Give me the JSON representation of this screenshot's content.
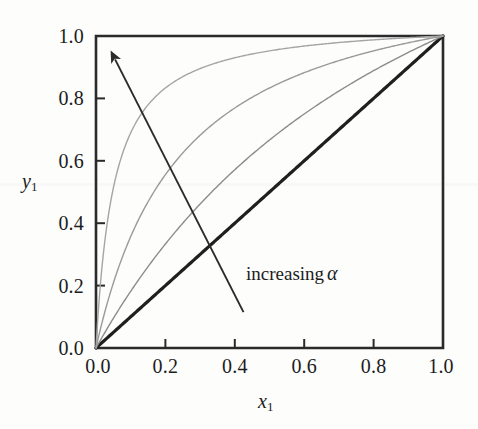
{
  "figure": {
    "name": "vapor-liquid-equilibrium-xy-diagram",
    "background_color": "#fdfdfc",
    "ink_color": "#1c1c1c"
  },
  "axes": {
    "x_title": "x",
    "x_title_sub": "1",
    "y_title": "y",
    "y_title_sub": "1",
    "x_tick_labels": [
      "0.0",
      "0.2",
      "0.4",
      "0.6",
      "0.8",
      "1.0"
    ],
    "y_tick_labels": [
      "0.0",
      "0.2",
      "0.4",
      "0.6",
      "0.8",
      "1.0"
    ],
    "x_tick_values": [
      0.0,
      0.2,
      0.4,
      0.6,
      0.8,
      1.0
    ],
    "y_tick_values": [
      0.0,
      0.2,
      0.4,
      0.6,
      0.8,
      1.0
    ],
    "frame_color": "#2a2a2a",
    "tick_direction": "in"
  },
  "annotation": {
    "label_text": "increasing",
    "label_symbol": "α",
    "arrow_start": [
      0.425,
      0.115
    ],
    "arrow_end": [
      0.055,
      0.925
    ],
    "arrow_color": "#2b2b2b"
  },
  "chart_data": {
    "type": "line",
    "title": "",
    "subtitle": "",
    "xlabel": "x1",
    "ylabel": "y1",
    "xlim": [
      0.0,
      1.0
    ],
    "ylim": [
      0.0,
      1.0
    ],
    "grid": false,
    "legend": "none",
    "annotations": [
      {
        "text": "increasing α",
        "x": 0.55,
        "y": 0.26,
        "arrow_from": [
          0.425,
          0.115
        ],
        "arrow_to": [
          0.055,
          0.925
        ]
      }
    ],
    "relation": "y1 = alpha*x1 / (1 + (alpha - 1)*x1)",
    "series": [
      {
        "name": "alpha = 1",
        "alpha": 1,
        "color": "#1f1f1f",
        "width": 3.2,
        "x": [
          0.0,
          0.1,
          0.2,
          0.3,
          0.4,
          0.5,
          0.6,
          0.7,
          0.8,
          0.9,
          1.0
        ],
        "values": [
          0.0,
          0.1,
          0.2,
          0.3,
          0.4,
          0.5,
          0.6,
          0.7,
          0.8,
          0.9,
          1.0
        ]
      },
      {
        "name": "alpha = 2",
        "alpha": 2,
        "color": "#8c8c8c",
        "width": 1.4,
        "x": [
          0.0,
          0.1,
          0.2,
          0.3,
          0.4,
          0.5,
          0.6,
          0.7,
          0.8,
          0.9,
          1.0
        ],
        "values": [
          0.0,
          0.182,
          0.333,
          0.462,
          0.571,
          0.667,
          0.75,
          0.824,
          0.889,
          0.947,
          1.0
        ]
      },
      {
        "name": "alpha = 5",
        "alpha": 5,
        "color": "#9a9a9a",
        "width": 1.4,
        "x": [
          0.0,
          0.1,
          0.2,
          0.3,
          0.4,
          0.5,
          0.6,
          0.7,
          0.8,
          0.9,
          1.0
        ],
        "values": [
          0.0,
          0.357,
          0.556,
          0.682,
          0.769,
          0.833,
          0.882,
          0.921,
          0.952,
          0.978,
          1.0
        ]
      },
      {
        "name": "alpha = 20",
        "alpha": 20,
        "color": "#a5a5a5",
        "width": 1.4,
        "x": [
          0.0,
          0.1,
          0.2,
          0.3,
          0.4,
          0.5,
          0.6,
          0.7,
          0.8,
          0.9,
          1.0
        ],
        "values": [
          0.0,
          0.69,
          0.833,
          0.896,
          0.93,
          0.952,
          0.968,
          0.979,
          0.988,
          0.994,
          1.0
        ]
      }
    ]
  }
}
